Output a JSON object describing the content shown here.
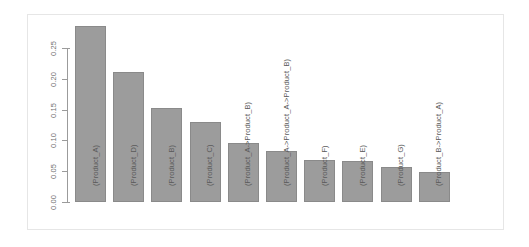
{
  "chart_data": {
    "type": "bar",
    "title": "",
    "subtitle": "",
    "xlabel": "",
    "ylabel": "",
    "categories": [
      "(Product_A)",
      "(Product_D)",
      "(Product_B)",
      "(Product_C)",
      "(Product_A->Product_B)",
      "(Product_A->Product_A->Product_B)",
      "(Product_F)",
      "(Product_E)",
      "(Product_G)",
      "(Product_B->Product_A)"
    ],
    "values": [
      0.285,
      0.211,
      0.152,
      0.13,
      0.095,
      0.083,
      0.068,
      0.066,
      0.057,
      0.048
    ],
    "ylim": [
      0.0,
      0.25
    ],
    "ytick_labels": [
      "0.00",
      "0.05",
      "0.10",
      "0.15",
      "0.20",
      "0.25"
    ],
    "ytick_values": [
      0.0,
      0.05,
      0.1,
      0.15,
      0.2,
      0.25
    ],
    "grid": false,
    "legend": null,
    "legend_position": "none",
    "bar_color": "#9c9c9c",
    "bar_border_color": "#8a8a8a",
    "axis_color": "#9b9b9b",
    "tick_label_color": "#6e6e6e",
    "bar_label_color": "#5a5a5a",
    "background_color": "#ffffff",
    "frame_color": "#e6e6e6"
  }
}
